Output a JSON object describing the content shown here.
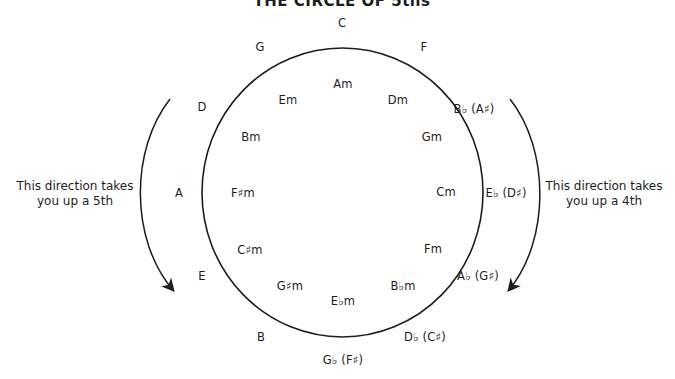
{
  "title": "THE CIRCLE OF 5ths",
  "colors": {
    "stroke": "#1d1d1d",
    "text": "#1d1d1d",
    "background": "#ffffff"
  },
  "major_keys": [
    {
      "id": "c",
      "label": "C",
      "x": 342,
      "y": 24
    },
    {
      "id": "g",
      "label": "G",
      "x": 260,
      "y": 48
    },
    {
      "id": "f",
      "label": "F",
      "x": 424,
      "y": 48
    },
    {
      "id": "d",
      "label": "D",
      "x": 202,
      "y": 108
    },
    {
      "id": "bb",
      "label": "B♭ (A♯)",
      "x": 474,
      "y": 110
    },
    {
      "id": "a",
      "label": "A",
      "x": 179,
      "y": 194
    },
    {
      "id": "eb",
      "label": "E♭ (D♯)",
      "x": 506,
      "y": 194
    },
    {
      "id": "e",
      "label": "E",
      "x": 202,
      "y": 277
    },
    {
      "id": "ab",
      "label": "A♭ (G♯)",
      "x": 478,
      "y": 277
    },
    {
      "id": "b",
      "label": "B",
      "x": 261,
      "y": 338
    },
    {
      "id": "db",
      "label": "D♭ (C♯)",
      "x": 425,
      "y": 338
    },
    {
      "id": "gb",
      "label": "G♭ (F♯)",
      "x": 343,
      "y": 361
    }
  ],
  "minor_keys": [
    {
      "id": "am",
      "label": "Am",
      "x": 343,
      "y": 85
    },
    {
      "id": "em",
      "label": "Em",
      "x": 288,
      "y": 101
    },
    {
      "id": "dm",
      "label": "Dm",
      "x": 398,
      "y": 101
    },
    {
      "id": "bm",
      "label": "Bm",
      "x": 251,
      "y": 138
    },
    {
      "id": "gm",
      "label": "Gm",
      "x": 432,
      "y": 138
    },
    {
      "id": "fsm",
      "label": "F♯m",
      "x": 243,
      "y": 194
    },
    {
      "id": "cm",
      "label": "Cm",
      "x": 446,
      "y": 193
    },
    {
      "id": "csm",
      "label": "C♯m",
      "x": 250,
      "y": 251
    },
    {
      "id": "fm",
      "label": "Fm",
      "x": 433,
      "y": 250
    },
    {
      "id": "gsm",
      "label": "G♯m",
      "x": 290,
      "y": 287
    },
    {
      "id": "bbm",
      "label": "B♭m",
      "x": 403,
      "y": 287
    },
    {
      "id": "ebm",
      "label": "E♭m",
      "x": 343,
      "y": 302
    }
  ],
  "annotations": {
    "left": {
      "line1": "This direction takes",
      "line2": "you up a 5th",
      "x": 75,
      "y": 194
    },
    "right": {
      "line1": "This direction takes",
      "line2": "you up a 4th",
      "x": 604,
      "y": 194
    }
  },
  "geometry": {
    "circle": {
      "cx": 342.5,
      "cy": 192.5,
      "rx": 140.5,
      "ry": 144.5
    },
    "left_arrow": "M170,99 C130,150 130,240 173,290",
    "right_arrow": "M510,99 C550,150 550,240 509,290"
  }
}
